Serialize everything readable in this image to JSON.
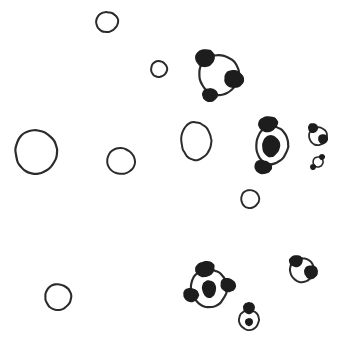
{
  "document": {
    "title": "Hand-drawn sketch of circles and panda faces",
    "medium": "ink line drawing",
    "background_color": "#ffffff",
    "ink_color": "#2b2b2b",
    "fill_color": "#1d1d1d",
    "width": 344,
    "height": 342
  },
  "shapes": {
    "plain_circles": [
      {
        "name": "circle-top-left-small",
        "cx": 107,
        "cy": 22,
        "rx": 11,
        "ry": 10,
        "rotate": -10,
        "stroke": 2.0
      },
      {
        "name": "circle-upper-mid-tiny",
        "cx": 159,
        "cy": 69,
        "rx": 8,
        "ry": 8,
        "rotate": 8,
        "stroke": 2.0
      },
      {
        "name": "circle-left-large",
        "cx": 36,
        "cy": 152,
        "rx": 21,
        "ry": 22,
        "rotate": -6,
        "stroke": 2.2
      },
      {
        "name": "circle-left-mid",
        "cx": 121,
        "cy": 161,
        "rx": 14,
        "ry": 13,
        "rotate": 12,
        "stroke": 2.0
      },
      {
        "name": "circle-center-tall",
        "cx": 196,
        "cy": 141,
        "rx": 15,
        "ry": 19,
        "rotate": -3,
        "stroke": 2.0
      },
      {
        "name": "circle-center-small",
        "cx": 250,
        "cy": 199,
        "rx": 9,
        "ry": 9,
        "rotate": 0,
        "stroke": 1.9
      },
      {
        "name": "circle-bottom-left",
        "cx": 58,
        "cy": 297,
        "rx": 13,
        "ry": 13,
        "rotate": 0,
        "stroke": 2.1
      }
    ],
    "panda_figures": [
      {
        "name": "panda-top-right",
        "cx": 219,
        "cy": 75,
        "rx": 20,
        "ry": 20,
        "rotate": -12,
        "stroke": 2.2,
        "eye_fill": "none",
        "blobs": [
          {
            "name": "ear-upper-left",
            "cx": 205,
            "cy": 58,
            "rx": 10,
            "ry": 9,
            "rotate": -20
          },
          {
            "name": "ear-right",
            "cx": 234,
            "cy": 79,
            "rx": 10,
            "ry": 9,
            "rotate": 15
          },
          {
            "name": "muzzle-lower-left",
            "cx": 210,
            "cy": 95,
            "rx": 8,
            "ry": 7,
            "rotate": -5
          }
        ]
      },
      {
        "name": "panda-right-center",
        "cx": 272,
        "cy": 145,
        "rx": 16,
        "ry": 19,
        "rotate": 6,
        "stroke": 2.2,
        "eye": {
          "cx": 271,
          "cy": 146,
          "rx": 9,
          "ry": 11,
          "rotate": 5
        },
        "blobs": [
          {
            "name": "ear-top",
            "cx": 268,
            "cy": 124,
            "rx": 10,
            "ry": 8,
            "rotate": -12
          },
          {
            "name": "ear-bottom-left",
            "cx": 263,
            "cy": 167,
            "rx": 9,
            "ry": 7,
            "rotate": 10
          }
        ]
      },
      {
        "name": "panda-far-right-small",
        "cx": 318,
        "cy": 136,
        "rx": 9,
        "ry": 9,
        "rotate": 0,
        "stroke": 1.8,
        "blobs": [
          {
            "name": "ear-top-left",
            "cx": 313,
            "cy": 128,
            "rx": 5,
            "ry": 5,
            "rotate": 0
          },
          {
            "name": "eye-right",
            "cx": 323,
            "cy": 139,
            "rx": 5,
            "ry": 5,
            "rotate": 0
          }
        ]
      },
      {
        "name": "panda-far-right-tiny",
        "cx": 318,
        "cy": 162,
        "rx": 5,
        "ry": 5,
        "rotate": 20,
        "stroke": 1.6,
        "blobs": [
          {
            "name": "ear-top-right",
            "cx": 322,
            "cy": 157,
            "rx": 3,
            "ry": 3,
            "rotate": 0
          },
          {
            "name": "ear-bottom-left",
            "cx": 313,
            "cy": 167,
            "rx": 3,
            "ry": 3,
            "rotate": 0
          }
        ]
      },
      {
        "name": "panda-bottom-center",
        "cx": 209,
        "cy": 288,
        "rx": 18,
        "ry": 19,
        "rotate": -8,
        "stroke": 2.2,
        "eye": {
          "cx": 209,
          "cy": 289,
          "rx": 7,
          "ry": 9,
          "rotate": -5
        },
        "blobs": [
          {
            "name": "ear-top",
            "cx": 205,
            "cy": 269,
            "rx": 10,
            "ry": 8,
            "rotate": -15
          },
          {
            "name": "ear-right",
            "cx": 228,
            "cy": 285,
            "rx": 8,
            "ry": 7,
            "rotate": 25
          },
          {
            "name": "ear-left",
            "cx": 191,
            "cy": 295,
            "rx": 8,
            "ry": 7,
            "rotate": 10
          }
        ]
      },
      {
        "name": "panda-bottom-right",
        "cx": 302,
        "cy": 270,
        "rx": 12,
        "ry": 12,
        "rotate": 0,
        "stroke": 2.0,
        "blobs": [
          {
            "name": "ear-top-left",
            "cx": 296,
            "cy": 261,
            "rx": 7,
            "ry": 6,
            "rotate": -10
          },
          {
            "name": "eye-right",
            "cx": 311,
            "cy": 272,
            "rx": 7,
            "ry": 7,
            "rotate": 0
          }
        ]
      },
      {
        "name": "panda-bottom-small",
        "cx": 249,
        "cy": 320,
        "rx": 10,
        "ry": 10,
        "rotate": 0,
        "stroke": 1.9,
        "eye": {
          "cx": 249,
          "cy": 322,
          "rx": 4,
          "ry": 4,
          "rotate": 0
        },
        "blobs": [
          {
            "name": "ear-top",
            "cx": 249,
            "cy": 308,
            "rx": 6,
            "ry": 6,
            "rotate": 0
          }
        ]
      }
    ]
  }
}
